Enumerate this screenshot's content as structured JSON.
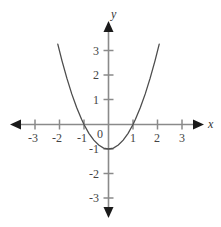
{
  "figure": {
    "background_color": "#ffffff",
    "axis_color": "#8a8a8a",
    "arrow_color": "#1a1a1a",
    "curve_color": "#4d4d4d",
    "label_color": "#444444"
  },
  "axes": {
    "x_axis_label": "x",
    "y_axis_label": "y",
    "origin_label": "0",
    "x_tick_labels": [
      "-3",
      "-2",
      "-1",
      "1",
      "2",
      "3"
    ],
    "y_tick_labels": [
      "3",
      "2",
      "1",
      "-1",
      "-2",
      "-3"
    ]
  },
  "chart_data": {
    "type": "line",
    "title": "",
    "subtitle": "",
    "xlabel": "x",
    "ylabel": "y",
    "xlim": [
      -3.6,
      3.6
    ],
    "ylim": [
      -3.9,
      4.3
    ],
    "xticks": [
      -3,
      -2,
      -1,
      0,
      1,
      2,
      3
    ],
    "yticks": [
      -3,
      -2,
      -1,
      0,
      1,
      2,
      3
    ],
    "xticklabels": [
      "-3",
      "-2",
      "-1",
      "0",
      "1",
      "2",
      "3"
    ],
    "yticklabels": [
      "-3",
      "-2",
      "-1",
      "0",
      "1",
      "2",
      "3"
    ],
    "grid": false,
    "legend": null,
    "series": [
      {
        "name": "y = x^2 - 1",
        "equation": "y = x^2 - 1",
        "vertex": [
          0,
          -1
        ],
        "x_intercepts": [
          -1,
          1
        ],
        "y_intercept": -1,
        "opens": "upward",
        "x": [
          -2.07,
          -1.9,
          -1.7,
          -1.5,
          -1.3,
          -1.1,
          -1.0,
          -0.8,
          -0.6,
          -0.4,
          -0.2,
          0,
          0.2,
          0.4,
          0.6,
          0.8,
          1.0,
          1.1,
          1.3,
          1.5,
          1.7,
          1.9,
          2.07
        ],
        "y": [
          3.28,
          2.61,
          1.89,
          1.25,
          0.69,
          0.21,
          0,
          -0.36,
          -0.64,
          -0.84,
          -0.96,
          -1,
          -0.96,
          -0.84,
          -0.64,
          -0.36,
          0,
          0.21,
          0.69,
          1.25,
          1.89,
          2.61,
          3.28
        ]
      }
    ]
  }
}
